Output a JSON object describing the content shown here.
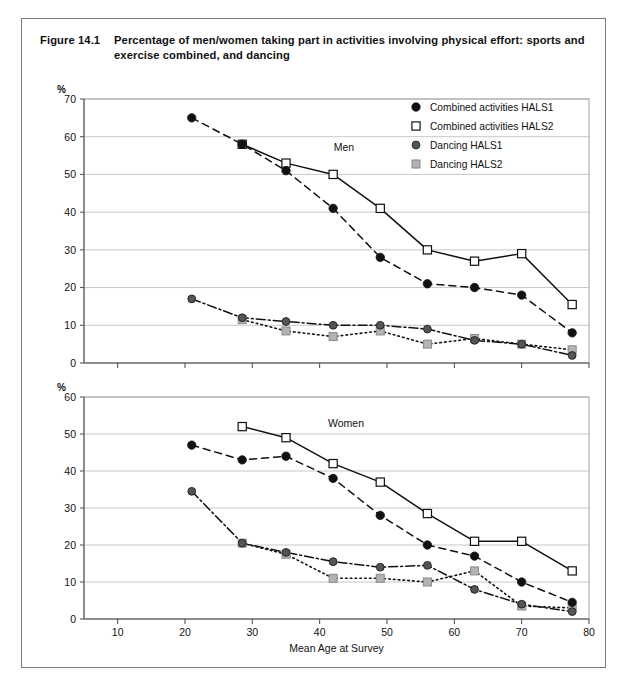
{
  "figure": {
    "number": "Figure 14.1",
    "caption": "Percentage of men/women taking part in activities involving physical effort: sports and exercise combined, and dancing"
  },
  "legend": {
    "items": [
      {
        "label": "Combined activities HALS1",
        "marker": "filled-circle",
        "color": "#111111"
      },
      {
        "label": "Combined activities HALS2",
        "marker": "open-square",
        "color": "#ffffff"
      },
      {
        "label": "Dancing HALS1",
        "marker": "dark-gray-circle",
        "color": "#555555"
      },
      {
        "label": "Dancing HALS2",
        "marker": "light-gray-square",
        "color": "#b3b3b3"
      }
    ]
  },
  "axis": {
    "x_label": "Mean Age at Survey",
    "x_ticks": [
      10,
      20,
      30,
      40,
      50,
      60,
      70,
      80
    ],
    "x_min": 5,
    "x_max": 80,
    "y_unit": "%"
  },
  "chart_data": [
    {
      "type": "line",
      "title": "Men",
      "panel": "men",
      "xlabel": "Mean Age at Survey",
      "ylabel": "%",
      "xlim": [
        5,
        80
      ],
      "ylim": [
        0,
        70
      ],
      "y_ticks": [
        0,
        10,
        20,
        30,
        40,
        50,
        60,
        70
      ],
      "x_ticks": [
        10,
        20,
        30,
        40,
        50,
        60,
        70,
        80
      ],
      "grid": true,
      "legend_position": "top-right",
      "series": [
        {
          "name": "Combined activities HALS1",
          "marker": "filled-circle",
          "line": "dashed",
          "points": [
            {
              "x": 21,
              "y": 65
            },
            {
              "x": 28.5,
              "y": 58
            },
            {
              "x": 35,
              "y": 51
            },
            {
              "x": 42,
              "y": 41
            },
            {
              "x": 49,
              "y": 28
            },
            {
              "x": 56,
              "y": 21
            },
            {
              "x": 63,
              "y": 20
            },
            {
              "x": 70,
              "y": 18
            },
            {
              "x": 77.5,
              "y": 8
            }
          ]
        },
        {
          "name": "Combined activities HALS2",
          "marker": "open-square",
          "line": "solid",
          "points": [
            {
              "x": 28.5,
              "y": 58
            },
            {
              "x": 35,
              "y": 53
            },
            {
              "x": 42,
              "y": 50
            },
            {
              "x": 49,
              "y": 41
            },
            {
              "x": 56,
              "y": 30
            },
            {
              "x": 63,
              "y": 27
            },
            {
              "x": 70,
              "y": 29
            },
            {
              "x": 77.5,
              "y": 15.5
            }
          ]
        },
        {
          "name": "Dancing HALS1",
          "marker": "dark-gray-circle",
          "line": "dash-dot",
          "points": [
            {
              "x": 21,
              "y": 17
            },
            {
              "x": 28.5,
              "y": 12
            },
            {
              "x": 35,
              "y": 11
            },
            {
              "x": 42,
              "y": 10
            },
            {
              "x": 49,
              "y": 10
            },
            {
              "x": 56,
              "y": 9
            },
            {
              "x": 63,
              "y": 6
            },
            {
              "x": 70,
              "y": 5
            },
            {
              "x": 77.5,
              "y": 2
            }
          ]
        },
        {
          "name": "Dancing HALS2",
          "marker": "light-gray-square",
          "line": "dotted",
          "points": [
            {
              "x": 28.5,
              "y": 11.5
            },
            {
              "x": 35,
              "y": 8.5
            },
            {
              "x": 42,
              "y": 7
            },
            {
              "x": 49,
              "y": 8.5
            },
            {
              "x": 56,
              "y": 5
            },
            {
              "x": 63,
              "y": 6.5
            },
            {
              "x": 70,
              "y": 5
            },
            {
              "x": 77.5,
              "y": 3.5
            }
          ]
        }
      ]
    },
    {
      "type": "line",
      "title": "Women",
      "panel": "women",
      "xlabel": "Mean Age at Survey",
      "ylabel": "%",
      "xlim": [
        5,
        80
      ],
      "ylim": [
        0,
        60
      ],
      "y_ticks": [
        0,
        10,
        20,
        30,
        40,
        50,
        60
      ],
      "x_ticks": [
        10,
        20,
        30,
        40,
        50,
        60,
        70,
        80
      ],
      "grid": true,
      "legend_position": "none",
      "series": [
        {
          "name": "Combined activities HALS1",
          "marker": "filled-circle",
          "line": "dashed",
          "points": [
            {
              "x": 21,
              "y": 47
            },
            {
              "x": 28.5,
              "y": 43
            },
            {
              "x": 35,
              "y": 44
            },
            {
              "x": 42,
              "y": 38
            },
            {
              "x": 49,
              "y": 28
            },
            {
              "x": 56,
              "y": 20
            },
            {
              "x": 63,
              "y": 17
            },
            {
              "x": 70,
              "y": 10
            },
            {
              "x": 77.5,
              "y": 4.5
            }
          ]
        },
        {
          "name": "Combined activities HALS2",
          "marker": "open-square",
          "line": "solid",
          "points": [
            {
              "x": 28.5,
              "y": 52
            },
            {
              "x": 35,
              "y": 49
            },
            {
              "x": 42,
              "y": 42
            },
            {
              "x": 49,
              "y": 37
            },
            {
              "x": 56,
              "y": 28.5
            },
            {
              "x": 63,
              "y": 21
            },
            {
              "x": 70,
              "y": 21
            },
            {
              "x": 77.5,
              "y": 13
            }
          ]
        },
        {
          "name": "Dancing HALS1",
          "marker": "dark-gray-circle",
          "line": "dash-dot",
          "points": [
            {
              "x": 21,
              "y": 34.5
            },
            {
              "x": 28.5,
              "y": 20.5
            },
            {
              "x": 35,
              "y": 18
            },
            {
              "x": 42,
              "y": 15.5
            },
            {
              "x": 49,
              "y": 14
            },
            {
              "x": 56,
              "y": 14.5
            },
            {
              "x": 63,
              "y": 8
            },
            {
              "x": 70,
              "y": 4
            },
            {
              "x": 77.5,
              "y": 2
            }
          ]
        },
        {
          "name": "Dancing HALS2",
          "marker": "light-gray-square",
          "line": "dotted",
          "points": [
            {
              "x": 28.5,
              "y": 20.5
            },
            {
              "x": 35,
              "y": 17.5
            },
            {
              "x": 42,
              "y": 11
            },
            {
              "x": 49,
              "y": 11
            },
            {
              "x": 56,
              "y": 10
            },
            {
              "x": 63,
              "y": 13
            },
            {
              "x": 70,
              "y": 3.5
            },
            {
              "x": 77.5,
              "y": 3
            }
          ]
        }
      ]
    }
  ]
}
